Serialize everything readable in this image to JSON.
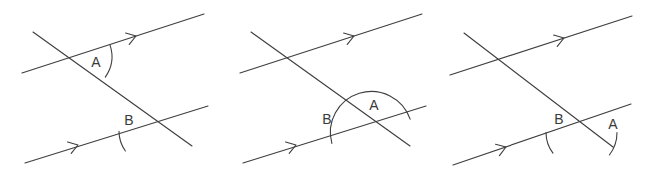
{
  "figure": {
    "background_color": "#ffffff",
    "line_color": "#3f3f3f",
    "label_color": "#3a3a3a",
    "width": 653,
    "height": 180,
    "panel_count": 3
  },
  "panels": [
    {
      "id": "panel-1",
      "name": "alternate-interior-angles",
      "offset_x": 0,
      "labels": {
        "angle_a": "A",
        "angle_b": "B"
      },
      "label_positions": {
        "angle_a": {
          "x": 96,
          "y": 63
        },
        "angle_b": {
          "x": 129,
          "y": 121
        }
      },
      "lines": {
        "parallel_upper": {
          "x1": 22,
          "y1": 73,
          "x2": 204,
          "y2": 14
        },
        "parallel_lower": {
          "x1": 25,
          "y1": 163,
          "x2": 208,
          "y2": 106
        },
        "transversal": {
          "x1": 33,
          "y1": 32,
          "x2": 192,
          "y2": 146
        }
      },
      "arrow_markers": [
        {
          "on": "parallel_upper",
          "x": 136,
          "y": 36,
          "angle_deg": -17.9
        },
        {
          "on": "parallel_lower",
          "x": 78,
          "y": 145,
          "angle_deg": -17.3
        }
      ],
      "arcs": [
        {
          "name": "arc-a",
          "vertex": "upper-intersection",
          "cx": 75.8,
          "cy": 56.2,
          "radius": 36,
          "start_deg": -17.9,
          "end_deg": 35.6
        },
        {
          "name": "arc-b",
          "vertex": "lower-intersection",
          "cx": 153.0,
          "cy": 131.3,
          "radius": 34,
          "start_deg": 180.0,
          "end_deg": 215.6
        }
      ]
    },
    {
      "id": "panel-2",
      "name": "co-interior-supplementary-angles",
      "offset_x": 218,
      "labels": {
        "angle_a": "A",
        "angle_b": "B"
      },
      "label_positions": {
        "angle_a": {
          "x": 156,
          "y": 106
        },
        "angle_b": {
          "x": 109,
          "y": 120
        }
      },
      "lines": {
        "parallel_upper": {
          "x1": 22,
          "y1": 73,
          "x2": 204,
          "y2": 14
        },
        "parallel_lower": {
          "x1": 25,
          "y1": 163,
          "x2": 208,
          "y2": 106
        },
        "transversal": {
          "x1": 33,
          "y1": 32,
          "x2": 192,
          "y2": 146
        }
      },
      "arrow_markers": [
        {
          "on": "parallel_upper",
          "x": 136,
          "y": 36,
          "angle_deg": -17.9
        },
        {
          "on": "parallel_lower",
          "x": 78,
          "y": 145,
          "angle_deg": -17.3
        }
      ],
      "arcs": [
        {
          "name": "arc-ab-semicircle",
          "vertex": "lower-intersection",
          "cx": 153.0,
          "cy": 131.3,
          "radius": 41,
          "start_deg": 162.7,
          "end_deg": 342.7
        }
      ]
    },
    {
      "id": "panel-3",
      "name": "vertically-opposite-angles",
      "offset_x": 436,
      "labels": {
        "angle_a": "A",
        "angle_b": "B"
      },
      "label_positions": {
        "angle_a": {
          "x": 177,
          "y": 125
        },
        "angle_b": {
          "x": 123,
          "y": 120
        }
      },
      "lines": {
        "parallel_upper": {
          "x1": 14,
          "y1": 75,
          "x2": 196,
          "y2": 16
        },
        "parallel_lower": {
          "x1": 17,
          "y1": 165,
          "x2": 195,
          "y2": 104
        },
        "transversal": {
          "x1": 28,
          "y1": 33,
          "x2": 177,
          "y2": 147
        }
      },
      "arrow_markers": [
        {
          "on": "parallel_upper",
          "x": 128,
          "y": 38,
          "angle_deg": -17.9
        },
        {
          "on": "parallel_lower",
          "x": 70,
          "y": 147,
          "angle_deg": -18.9
        }
      ],
      "arcs": [
        {
          "name": "arc-b",
          "vertex": "lower-intersection",
          "cx": 144.0,
          "cy": 132.5,
          "radius": 34,
          "start_deg": 180.0,
          "end_deg": 217.4
        },
        {
          "name": "arc-a",
          "vertex": "lower-intersection",
          "cx": 144.0,
          "cy": 132.5,
          "radius": 37,
          "start_deg": 0.0,
          "end_deg": 37.4
        }
      ]
    }
  ]
}
